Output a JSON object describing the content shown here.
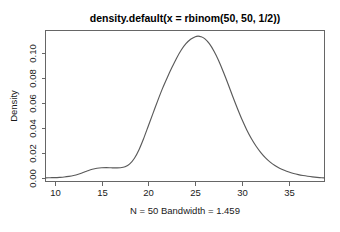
{
  "chart_data": {
    "type": "line",
    "title": "density.default(x = rbinom(50, 50, 1/2))",
    "subtitle": "N = 50   Bandwidth = 1.459",
    "xlabel": "",
    "ylabel": "Density",
    "xlim": [
      9.0,
      38.8
    ],
    "ylim": [
      -0.0025,
      0.1175
    ],
    "grid": false,
    "legend": null,
    "xticks": [
      10,
      15,
      20,
      25,
      30,
      35
    ],
    "xtick_labels": [
      "10",
      "15",
      "20",
      "25",
      "30",
      "35"
    ],
    "yticks": [
      0.0,
      0.02,
      0.04,
      0.06,
      0.08,
      0.1
    ],
    "ytick_labels": [
      "0.00",
      "0.02",
      "0.04",
      "0.06",
      "0.08",
      "0.10"
    ],
    "line_color": "#5a5a5a",
    "box_color": "#666666",
    "background": "#ffffff",
    "series": [
      {
        "name": "density",
        "x": [
          9.0,
          9.5,
          10.0,
          10.5,
          11.0,
          11.5,
          12.0,
          12.5,
          13.0,
          13.5,
          14.0,
          14.5,
          15.0,
          15.5,
          16.0,
          16.5,
          17.0,
          17.5,
          18.0,
          18.5,
          19.0,
          19.5,
          20.0,
          20.5,
          21.0,
          21.5,
          22.0,
          22.5,
          23.0,
          23.5,
          24.0,
          24.5,
          25.0,
          25.3,
          25.6,
          26.0,
          26.5,
          27.0,
          27.5,
          28.0,
          28.5,
          29.0,
          29.5,
          30.0,
          30.5,
          31.0,
          31.5,
          32.0,
          32.5,
          33.0,
          33.5,
          34.0,
          34.5,
          35.0,
          35.5,
          36.0,
          36.5,
          37.0,
          37.5,
          38.0,
          38.5,
          38.8
        ],
        "values": [
          0.0004,
          0.0005,
          0.0006,
          0.0008,
          0.0011,
          0.0016,
          0.0023,
          0.0033,
          0.0046,
          0.006,
          0.0072,
          0.008,
          0.0084,
          0.0085,
          0.0084,
          0.0083,
          0.0084,
          0.0092,
          0.0115,
          0.016,
          0.023,
          0.032,
          0.042,
          0.052,
          0.062,
          0.0715,
          0.08,
          0.088,
          0.0955,
          0.102,
          0.107,
          0.1105,
          0.1126,
          0.113,
          0.1126,
          0.111,
          0.107,
          0.101,
          0.0935,
          0.0845,
          0.075,
          0.065,
          0.0555,
          0.0465,
          0.0385,
          0.0315,
          0.0255,
          0.0205,
          0.0163,
          0.0129,
          0.0102,
          0.0081,
          0.0064,
          0.005,
          0.0039,
          0.003,
          0.0023,
          0.0017,
          0.0012,
          0.0008,
          0.0005,
          0.0004
        ]
      }
    ]
  },
  "figure": {
    "title": "density.default(x = rbinom(50, 50, 1/2))",
    "subtitle": "N = 50   Bandwidth = 1.459",
    "ylabel": "Density"
  }
}
